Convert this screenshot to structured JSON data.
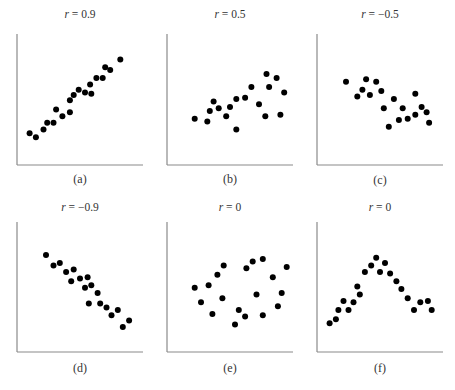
{
  "chart_data": [
    {
      "type": "scatter",
      "id": "a",
      "title_var": "r",
      "title_value": "= 0.9",
      "caption": "(a)",
      "xlabel": "",
      "ylabel": "",
      "xlim": [
        0,
        10
      ],
      "ylim": [
        0,
        10
      ],
      "grid": false,
      "points": [
        [
          1.0,
          2.4
        ],
        [
          1.5,
          2.1
        ],
        [
          2.1,
          2.7
        ],
        [
          2.4,
          3.2
        ],
        [
          2.9,
          3.2
        ],
        [
          3.1,
          4.2
        ],
        [
          3.6,
          3.7
        ],
        [
          4.2,
          4.0
        ],
        [
          4.2,
          4.9
        ],
        [
          4.5,
          5.3
        ],
        [
          4.9,
          5.7
        ],
        [
          5.4,
          5.5
        ],
        [
          5.9,
          5.4
        ],
        [
          5.8,
          6.1
        ],
        [
          6.3,
          6.6
        ],
        [
          6.8,
          6.6
        ],
        [
          7.0,
          7.4
        ],
        [
          7.4,
          7.2
        ],
        [
          8.2,
          8.0
        ]
      ]
    },
    {
      "type": "scatter",
      "id": "b",
      "title_var": "r",
      "title_value": "= 0.5",
      "caption": "(b)",
      "xlabel": "",
      "ylabel": "",
      "xlim": [
        0,
        10
      ],
      "ylim": [
        0,
        10
      ],
      "grid": false,
      "points": [
        [
          2.2,
          3.5
        ],
        [
          3.2,
          3.3
        ],
        [
          3.4,
          4.1
        ],
        [
          3.7,
          4.8
        ],
        [
          4.1,
          4.3
        ],
        [
          4.7,
          3.7
        ],
        [
          5.0,
          4.4
        ],
        [
          5.5,
          5.0
        ],
        [
          5.5,
          2.7
        ],
        [
          6.2,
          5.1
        ],
        [
          6.7,
          5.9
        ],
        [
          7.3,
          4.6
        ],
        [
          7.8,
          3.7
        ],
        [
          7.9,
          6.9
        ],
        [
          8.1,
          5.9
        ],
        [
          8.7,
          6.6
        ],
        [
          9.0,
          3.8
        ],
        [
          9.3,
          5.5
        ]
      ]
    },
    {
      "type": "scatter",
      "id": "c",
      "title_var": "r",
      "title_value": "= −0.5",
      "caption": "(c)",
      "xlabel": "",
      "ylabel": "",
      "xlim": [
        0,
        10
      ],
      "ylim": [
        0,
        10
      ],
      "grid": false,
      "points": [
        [
          2.3,
          6.3
        ],
        [
          3.2,
          5.2
        ],
        [
          3.6,
          5.7
        ],
        [
          3.9,
          6.5
        ],
        [
          4.2,
          5.3
        ],
        [
          4.7,
          6.3
        ],
        [
          5.1,
          5.6
        ],
        [
          5.3,
          4.3
        ],
        [
          5.7,
          2.9
        ],
        [
          6.1,
          5.0
        ],
        [
          6.5,
          3.4
        ],
        [
          6.8,
          4.3
        ],
        [
          7.2,
          3.5
        ],
        [
          7.8,
          5.4
        ],
        [
          7.8,
          3.8
        ],
        [
          8.3,
          4.4
        ],
        [
          8.7,
          4.0
        ],
        [
          8.9,
          3.2
        ]
      ]
    },
    {
      "type": "scatter",
      "id": "d",
      "title_var": "r",
      "title_value": "= −0.9",
      "caption": "(d)",
      "xlabel": "",
      "ylabel": "",
      "xlim": [
        0,
        10
      ],
      "ylim": [
        0,
        10
      ],
      "grid": false,
      "points": [
        [
          2.3,
          7.4
        ],
        [
          2.9,
          6.6
        ],
        [
          3.4,
          6.8
        ],
        [
          3.9,
          6.1
        ],
        [
          4.5,
          6.3
        ],
        [
          4.3,
          5.4
        ],
        [
          5.0,
          5.6
        ],
        [
          5.6,
          5.7
        ],
        [
          5.4,
          4.9
        ],
        [
          5.9,
          5.1
        ],
        [
          6.4,
          4.5
        ],
        [
          5.7,
          3.7
        ],
        [
          6.6,
          3.7
        ],
        [
          7.1,
          3.4
        ],
        [
          8.0,
          3.2
        ],
        [
          7.5,
          2.8
        ],
        [
          8.9,
          2.4
        ],
        [
          8.4,
          1.9
        ]
      ]
    },
    {
      "type": "scatter",
      "id": "e",
      "title_var": "r",
      "title_value": "= 0",
      "caption": "(e)",
      "xlabel": "",
      "ylabel": "",
      "xlim": [
        0,
        10
      ],
      "ylim": [
        0,
        10
      ],
      "grid": false,
      "points": [
        [
          2.2,
          4.9
        ],
        [
          2.7,
          3.8
        ],
        [
          3.3,
          5.1
        ],
        [
          3.6,
          2.9
        ],
        [
          4.0,
          5.9
        ],
        [
          4.4,
          4.1
        ],
        [
          4.5,
          6.6
        ],
        [
          5.4,
          2.1
        ],
        [
          5.7,
          3.2
        ],
        [
          6.2,
          2.7
        ],
        [
          6.3,
          6.4
        ],
        [
          6.8,
          6.9
        ],
        [
          7.1,
          4.4
        ],
        [
          7.6,
          7.1
        ],
        [
          7.6,
          2.8
        ],
        [
          8.4,
          5.7
        ],
        [
          8.8,
          3.5
        ],
        [
          9.1,
          4.5
        ],
        [
          9.5,
          6.5
        ]
      ]
    },
    {
      "type": "scatter",
      "id": "f",
      "title_var": "r",
      "title_value": "= 0",
      "caption": "(f)",
      "xlabel": "",
      "ylabel": "",
      "xlim": [
        0,
        10
      ],
      "ylim": [
        0,
        10
      ],
      "grid": false,
      "points": [
        [
          1.0,
          2.2
        ],
        [
          1.5,
          2.5
        ],
        [
          1.7,
          3.2
        ],
        [
          2.1,
          3.9
        ],
        [
          2.5,
          3.2
        ],
        [
          2.9,
          3.8
        ],
        [
          3.2,
          5.0
        ],
        [
          3.4,
          4.4
        ],
        [
          3.8,
          6.1
        ],
        [
          4.3,
          6.6
        ],
        [
          4.7,
          7.2
        ],
        [
          5.0,
          6.1
        ],
        [
          5.4,
          6.8
        ],
        [
          5.8,
          6.0
        ],
        [
          6.3,
          5.4
        ],
        [
          6.7,
          4.8
        ],
        [
          7.2,
          4.1
        ],
        [
          7.7,
          3.2
        ],
        [
          8.2,
          3.8
        ],
        [
          8.8,
          3.9
        ],
        [
          9.1,
          3.2
        ]
      ]
    }
  ]
}
